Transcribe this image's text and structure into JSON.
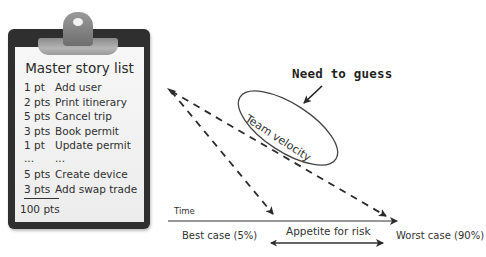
{
  "clipboard": {
    "title": "Master story list",
    "stories": [
      {
        "points": "1 pt",
        "name": "Add user"
      },
      {
        "points": "2 pts",
        "name": "Print itinerary"
      },
      {
        "points": "5 pts",
        "name": "Cancel trip"
      },
      {
        "points": "3 pts",
        "name": "Book permit"
      },
      {
        "points": "1 pt",
        "name": "Update permit"
      },
      {
        "points": "...",
        "name": "..."
      },
      {
        "points": "5 pts",
        "name": "Create device"
      },
      {
        "points": "3 pts",
        "name": "Add swap trade"
      }
    ],
    "total": "100 pts"
  },
  "diagram": {
    "callout": "Need to guess",
    "ellipse_label": "Team velocity",
    "axis_label": "Time",
    "best_case": "Best case (5%)",
    "worst_case": "Worst case (90%)",
    "range_label": "Appetite for risk"
  },
  "colors": {
    "clipboard": "#2f2f2f",
    "paper": "#f2f2f2",
    "ink": "#333333"
  }
}
